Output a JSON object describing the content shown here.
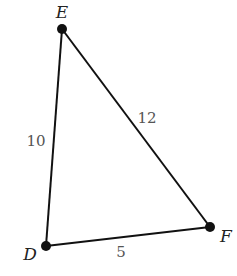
{
  "diagram": {
    "type": "triangle",
    "vertices": [
      {
        "name": "E",
        "x": 62,
        "y": 29,
        "label_x": 62,
        "label_y": 18
      },
      {
        "name": "D",
        "x": 46,
        "y": 246,
        "label_x": 30,
        "label_y": 258
      },
      {
        "name": "F",
        "x": 210,
        "y": 227,
        "label_x": 226,
        "label_y": 240
      }
    ],
    "sides": [
      {
        "from": "E",
        "to": "D",
        "length": "10",
        "label_x": 36,
        "label_y": 146
      },
      {
        "from": "E",
        "to": "F",
        "length": "12",
        "label_x": 147,
        "label_y": 123
      },
      {
        "from": "D",
        "to": "F",
        "length": "5",
        "label_x": 121,
        "label_y": 257
      }
    ],
    "colors": {
      "line": "#111111",
      "point": "#111111",
      "side_label": "#555555"
    }
  }
}
